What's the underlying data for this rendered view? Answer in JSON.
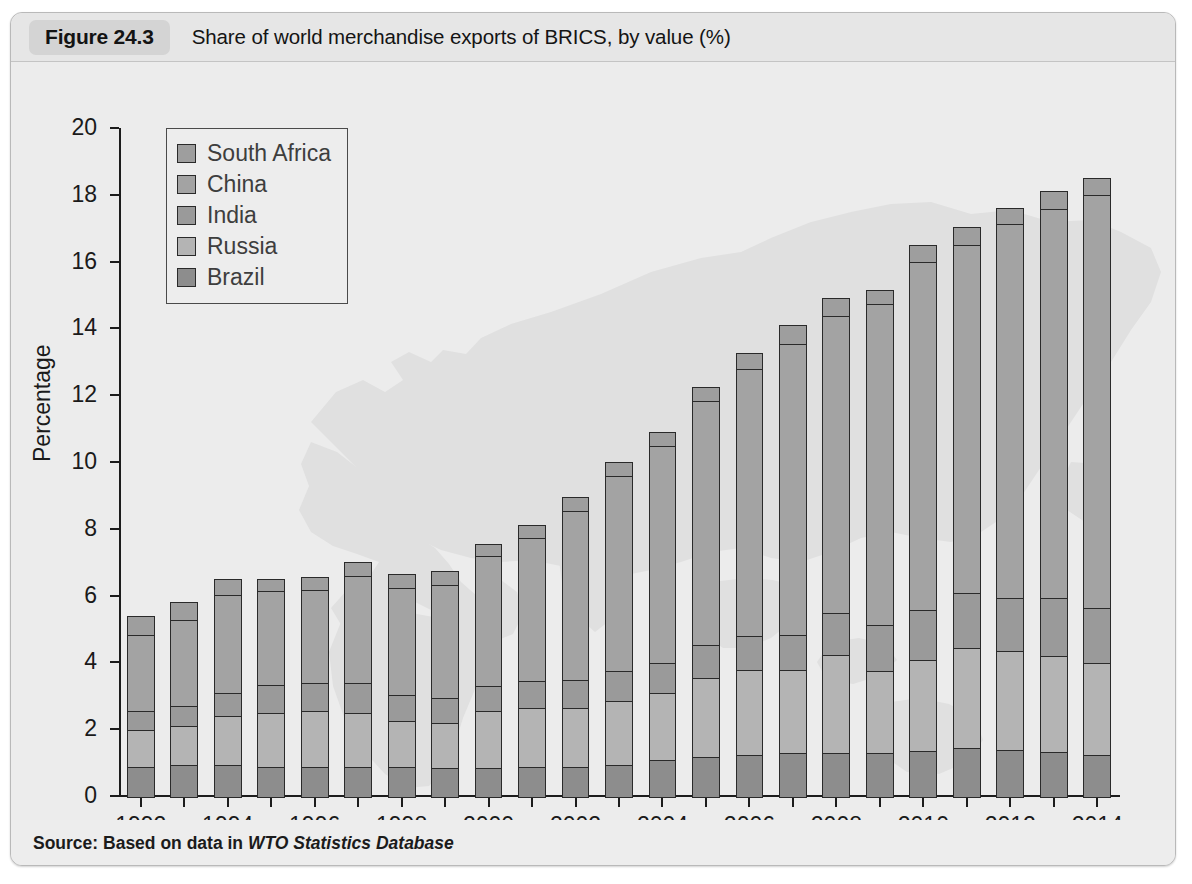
{
  "figure": {
    "number": "Figure 24.3",
    "caption": "Share of world merchandise exports of BRICS, by value (%)",
    "source_prefix": "Source: Based on data in ",
    "source_italic": "WTO Statistics Database"
  },
  "colors": {
    "card_background": "#ededed",
    "header_background": "#e6e6e6",
    "number_chip": "#d4d4d4",
    "plot_background": "#ececec",
    "map_watermark": "#e0e0e0",
    "axis": "#1c1c1c",
    "bar_outline": "#2a2a2a",
    "brazil": "#8d8d8d",
    "russia": "#b4b4b4",
    "india": "#9a9a9a",
    "china": "#a3a3a3",
    "south_africa": "#9e9e9e"
  },
  "chart_data": {
    "type": "bar",
    "stacked": true,
    "title": "Share of world merchandise exports of BRICS, by value (%)",
    "xlabel": "",
    "ylabel": "Percentage",
    "ylim": [
      0,
      20
    ],
    "ytick_step": 2,
    "yticks": [
      0,
      2,
      4,
      6,
      8,
      10,
      12,
      14,
      16,
      18,
      20
    ],
    "grid": false,
    "legend_position": "upper-left",
    "legend_order": [
      "South Africa",
      "China",
      "India",
      "Russia",
      "Brazil"
    ],
    "stack_order_bottom_to_top": [
      "Brazil",
      "Russia",
      "India",
      "China",
      "South Africa"
    ],
    "categories": [
      "1992",
      "1993",
      "1994",
      "1995",
      "1996",
      "1997",
      "1998",
      "1999",
      "2000",
      "2001",
      "2002",
      "2003",
      "2004",
      "2005",
      "2006",
      "2007",
      "2008",
      "2009",
      "2010",
      "2011",
      "2012",
      "2013",
      "2014"
    ],
    "xtick_labels": [
      "1992",
      "1994",
      "1996",
      "1998",
      "2000",
      "2002",
      "2004",
      "2006",
      "2008",
      "2010",
      "2012",
      "2014"
    ],
    "series": [
      {
        "name": "Brazil",
        "color": "#8d8d8d",
        "values": [
          0.9,
          0.95,
          0.95,
          0.9,
          0.9,
          0.9,
          0.9,
          0.85,
          0.85,
          0.9,
          0.9,
          0.95,
          1.1,
          1.2,
          1.25,
          1.3,
          1.3,
          1.3,
          1.35,
          1.45,
          1.4,
          1.35,
          1.25
        ]
      },
      {
        "name": "Russia",
        "color": "#b4b4b4",
        "values": [
          1.1,
          1.15,
          1.45,
          1.6,
          1.65,
          1.6,
          1.35,
          1.35,
          1.7,
          1.75,
          1.75,
          1.9,
          2.0,
          2.35,
          2.55,
          2.5,
          2.95,
          2.45,
          2.75,
          3.0,
          2.95,
          2.85,
          2.75
        ]
      },
      {
        "name": "India",
        "color": "#9a9a9a",
        "values": [
          0.55,
          0.6,
          0.7,
          0.85,
          0.85,
          0.9,
          0.8,
          0.75,
          0.75,
          0.8,
          0.85,
          0.9,
          0.9,
          1.0,
          1.0,
          1.05,
          1.25,
          1.4,
          1.5,
          1.65,
          1.6,
          1.75,
          1.65
        ]
      },
      {
        "name": "China",
        "color": "#a3a3a3",
        "values": [
          2.3,
          2.6,
          2.95,
          2.8,
          2.8,
          3.2,
          3.2,
          3.4,
          3.9,
          4.3,
          5.05,
          5.85,
          6.5,
          7.3,
          8.0,
          8.7,
          8.9,
          9.6,
          10.4,
          10.4,
          11.2,
          11.65,
          12.35
        ]
      },
      {
        "name": "South Africa",
        "color": "#9e9e9e",
        "values": [
          0.55,
          0.5,
          0.45,
          0.35,
          0.35,
          0.4,
          0.4,
          0.4,
          0.35,
          0.35,
          0.4,
          0.4,
          0.4,
          0.4,
          0.45,
          0.55,
          0.5,
          0.4,
          0.5,
          0.55,
          0.45,
          0.5,
          0.5
        ]
      }
    ],
    "totals": [
      5.4,
      5.8,
      6.5,
      6.5,
      6.55,
      7.0,
      6.65,
      6.75,
      7.55,
      8.1,
      8.95,
      10.0,
      10.9,
      12.25,
      13.25,
      14.1,
      14.9,
      15.15,
      16.5,
      17.05,
      17.6,
      18.1,
      18.5
    ]
  }
}
